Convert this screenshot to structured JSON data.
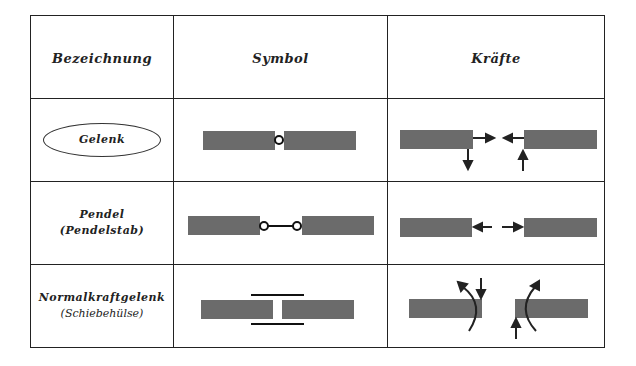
{
  "table": {
    "headers": [
      "Bezeichnung",
      "Symbol",
      "Kräfte"
    ],
    "rows": [
      {
        "name": "Gelenk",
        "subname": ""
      },
      {
        "name": "Pendel",
        "subname": "(Pendelstab)"
      },
      {
        "name": "Normalkraftgelenk",
        "subname": "(Schiebehülse)"
      }
    ]
  },
  "colors": {
    "bar": "#6b6b6b",
    "line": "#222222"
  }
}
